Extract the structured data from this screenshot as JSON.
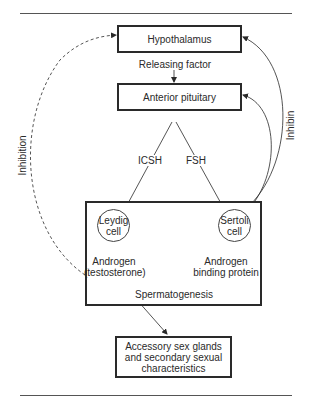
{
  "diagram": {
    "type": "flowchart",
    "nodes": {
      "hypothalamus": "Hypothalamus",
      "anterior_pituitary": "Anterior pituitary",
      "leydig_line1": "Leydig",
      "leydig_line2": "cell",
      "sertoli_line1": "Sertoli",
      "sertoli_line2": "cell",
      "androgen_line1": "Androgen",
      "androgen_line2": "(testosterone)",
      "abp_line1": "Androgen",
      "abp_line2": "binding protein",
      "spermatogenesis": "Spermatogenesis",
      "accessory_line1": "Accessory sex glands",
      "accessory_line2": "and secondary sexual",
      "accessory_line3": "characteristics"
    },
    "edge_labels": {
      "releasing_factor": "Releasing factor",
      "icsh": "ICSH",
      "fsh": "FSH",
      "inhibition": "Inhibition",
      "inhibin": "Inhibin"
    },
    "edges": [
      {
        "from": "Hypothalamus",
        "to": "Anterior pituitary",
        "label": "Releasing factor",
        "style": "solid"
      },
      {
        "from": "Anterior pituitary",
        "to": "Leydig cell",
        "label": "ICSH",
        "style": "solid"
      },
      {
        "from": "Anterior pituitary",
        "to": "Sertoli cell",
        "label": "FSH",
        "style": "solid"
      },
      {
        "from": "Leydig cell",
        "to": "Androgen (testosterone)",
        "style": "solid"
      },
      {
        "from": "Sertoli cell",
        "to": "Androgen binding protein",
        "style": "solid"
      },
      {
        "from": "Androgen (testosterone)",
        "to": "Accessory sex glands and secondary sexual characteristics",
        "style": "solid"
      },
      {
        "from": "Testis",
        "to": "Hypothalamus",
        "label": "Inhibition",
        "style": "dashed"
      },
      {
        "from": "Sertoli cell",
        "to": "Hypothalamus",
        "label": "Inhibin",
        "style": "solid"
      },
      {
        "from": "Sertoli cell",
        "to": "Anterior pituitary",
        "label": "Inhibin",
        "style": "solid"
      }
    ],
    "colors": {
      "line": "#2a2a2a",
      "background": "#ffffff"
    }
  }
}
